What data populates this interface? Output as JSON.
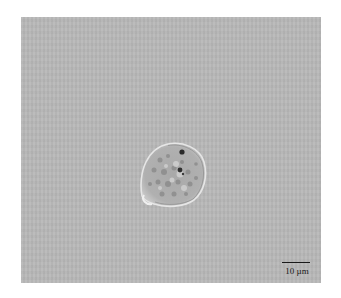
{
  "image": {
    "subject": "protist-cell-micrograph",
    "background_color": "#b9b9b9",
    "cell_fill": "#b3b3b3",
    "cell_outline": "#e8e8e8"
  },
  "scale_bar": {
    "label": "10 µm"
  }
}
